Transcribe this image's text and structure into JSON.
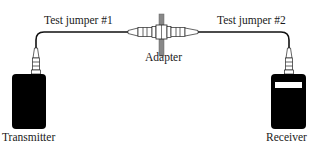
{
  "diagram": {
    "labels": {
      "jumper1": "Test jumper #1",
      "jumper2": "Test jumper #2",
      "adapter": "Adapter",
      "transmitter": "Transmitter",
      "receiver": "Receiver"
    },
    "colors": {
      "device_fill": "#000000",
      "cable": "#111111",
      "adapter_bar": "#888888",
      "receiver_display": "#ffffff",
      "text": "#1a1a1a"
    }
  }
}
